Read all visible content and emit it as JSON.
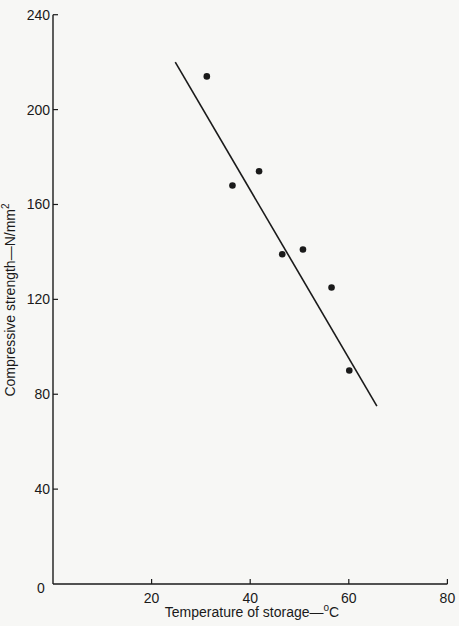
{
  "chart_data": {
    "type": "scatter",
    "title": "",
    "xlabel": "Temperature of storage—°C",
    "ylabel": "Compressive strength—N/mm²",
    "xlim": [
      0,
      80
    ],
    "ylim": [
      0,
      240
    ],
    "x_ticks": [
      0,
      20,
      40,
      60,
      80
    ],
    "y_ticks": [
      0,
      40,
      80,
      120,
      160,
      200,
      240
    ],
    "x_tick_labels": [
      "0",
      "20",
      "40",
      "60",
      "80"
    ],
    "y_tick_labels": [
      "",
      "40",
      "80",
      "120",
      "160",
      "200",
      "240"
    ],
    "grid": false,
    "legend": null,
    "series": [
      {
        "name": "Measured points",
        "kind": "scatter",
        "x": [
          31.2,
          36.4,
          41.8,
          46.5,
          50.7,
          56.5,
          60.1
        ],
        "y": [
          214,
          168,
          174,
          139,
          141,
          125,
          90
        ]
      },
      {
        "name": "Fitted line",
        "kind": "line",
        "x": [
          24.8,
          65.7
        ],
        "y": [
          220,
          75
        ]
      }
    ]
  },
  "labels": {
    "origin": "0",
    "xlabel_main": "Temperature of storage—",
    "xlabel_deg": "o",
    "xlabel_unit": "C",
    "ylabel_main": "Compressive strength—N/mm",
    "ylabel_sup": "2"
  },
  "colors": {
    "ink": "#1a1a1a",
    "background": "#f7f7f5"
  }
}
